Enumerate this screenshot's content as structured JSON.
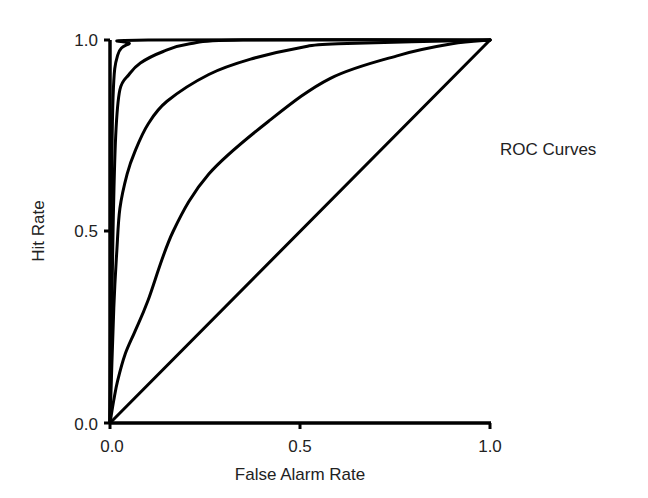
{
  "chart_data": {
    "type": "line",
    "title": "",
    "annotation": "ROC Curves",
    "xlabel": "False Alarm Rate",
    "ylabel": "Hit Rate",
    "xlim": [
      0,
      1
    ],
    "ylim": [
      0,
      1
    ],
    "x_ticks": [
      "0.0",
      "0.5",
      "1.0"
    ],
    "y_ticks": [
      "0.0",
      "0.5",
      "1.0"
    ],
    "grid": false,
    "legend": null,
    "series": [
      {
        "name": "curve-1 (highest sensitivity)",
        "points": [
          [
            0,
            0
          ],
          [
            0.003,
            0.5
          ],
          [
            0.008,
            0.85
          ],
          [
            0.02,
            0.96
          ],
          [
            0.05,
            0.99
          ],
          [
            0.1,
            1.0
          ],
          [
            1,
            1
          ]
        ]
      },
      {
        "name": "curve-2",
        "points": [
          [
            0,
            0
          ],
          [
            0.008,
            0.5
          ],
          [
            0.015,
            0.75
          ],
          [
            0.026,
            0.87
          ],
          [
            0.05,
            0.91
          ],
          [
            0.08,
            0.94
          ],
          [
            0.14,
            0.97
          ],
          [
            0.21,
            0.99
          ],
          [
            0.35,
            1.0
          ],
          [
            1,
            1
          ]
        ]
      },
      {
        "name": "curve-3",
        "points": [
          [
            0,
            0
          ],
          [
            0.01,
            0.3
          ],
          [
            0.018,
            0.45
          ],
          [
            0.026,
            0.56
          ],
          [
            0.045,
            0.65
          ],
          [
            0.066,
            0.71
          ],
          [
            0.1,
            0.78
          ],
          [
            0.15,
            0.84
          ],
          [
            0.26,
            0.91
          ],
          [
            0.37,
            0.95
          ],
          [
            0.5,
            0.98
          ],
          [
            0.6,
            0.99
          ],
          [
            1,
            1
          ]
        ]
      },
      {
        "name": "curve-4 (lowest sensitivity)",
        "points": [
          [
            0,
            0
          ],
          [
            0.01,
            0.06
          ],
          [
            0.02,
            0.11
          ],
          [
            0.04,
            0.18
          ],
          [
            0.066,
            0.24
          ],
          [
            0.1,
            0.32
          ],
          [
            0.166,
            0.5
          ],
          [
            0.26,
            0.65
          ],
          [
            0.42,
            0.79
          ],
          [
            0.58,
            0.9
          ],
          [
            0.76,
            0.96
          ],
          [
            0.9,
            0.99
          ],
          [
            1,
            1
          ]
        ]
      },
      {
        "name": "chance diagonal",
        "points": [
          [
            0,
            0
          ],
          [
            1,
            1
          ]
        ]
      }
    ]
  }
}
